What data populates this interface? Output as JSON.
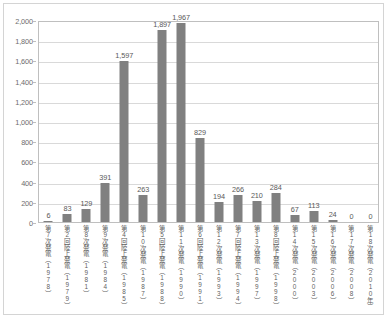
{
  "chart_data": {
    "type": "bar",
    "title": "",
    "subtitle": "",
    "xlabel": "",
    "ylabel": "",
    "ylim": [
      0,
      2000
    ],
    "ytick_step": 200,
    "grid": true,
    "legend": null,
    "bar_color": "#808080",
    "plot_border_color": "#bfbfbf",
    "gridline_color": "#d9d9d9",
    "frame_border_color": "#d4d4d4",
    "value_label_color": "#595959",
    "tick_label_color": "#6d6d6d",
    "ytick_labels": [
      "2,000",
      "1,800",
      "1,600",
      "1,400",
      "1,200",
      "1,000",
      "800",
      "600",
      "400",
      "200",
      "0"
    ],
    "ytick_values": [
      2000,
      1800,
      1600,
      1400,
      1200,
      1000,
      800,
      600,
      400,
      200,
      0
    ],
    "categories": [
      "第7次発電（1978）",
      "第2回陸上発電（1979）",
      "第8次発電（1981）",
      "第9次発電（1984）",
      "第4回陸上発電（1985）",
      "第10次発電（1987）",
      "第5回陸上発電（1988）",
      "第11次発電（1990）",
      "第6回陸上発電（1991）",
      "第12次発電（1993）",
      "第7回陸上発電（1994）",
      "第13次発電（1997）",
      "第8回陸上発電（1998）",
      "第14次発電（2000）",
      "第15次発電（2003）",
      "第16次発電（2006）",
      "第17次発電（2008）",
      "第18次発電（2010年）"
    ],
    "values": [
      6,
      83,
      129,
      391,
      1597,
      263,
      1897,
      1967,
      829,
      194,
      266,
      210,
      284,
      67,
      113,
      24,
      0,
      0
    ],
    "value_labels": [
      "6",
      "83",
      "129",
      "391",
      "1,597",
      "263",
      "1,897",
      "1,967",
      "829",
      "194",
      "266",
      "210",
      "284",
      "67",
      "113",
      "24",
      "0",
      "0"
    ]
  }
}
